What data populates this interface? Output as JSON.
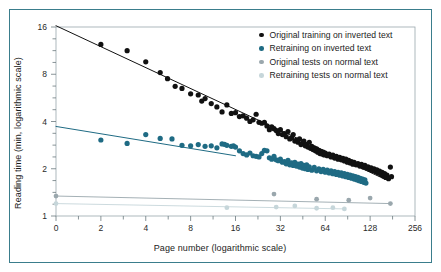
{
  "figure": {
    "frame_color": "#3a7d8c",
    "background": "#ffffff",
    "plot_border_color": "#9aa7ad"
  },
  "chart_data": {
    "type": "scatter",
    "title": "",
    "xlabel": "Page number (logarithmic scale)",
    "ylabel": "Reading time (min, logarithmic scale)",
    "xscale": "log2",
    "yscale": "log2",
    "xlim": [
      1,
      256
    ],
    "ylim": [
      1,
      16
    ],
    "grid": false,
    "legend_position": "top-right",
    "xticks": [
      1,
      2,
      4,
      8,
      16,
      32,
      64,
      128,
      256
    ],
    "xtick_labels": [
      "0",
      "2",
      "4",
      "8",
      "16",
      "32",
      "64",
      "128",
      "256"
    ],
    "yticks": [
      1,
      2,
      4,
      8,
      16
    ],
    "ytick_labels": [
      "1",
      "2",
      "4",
      "8",
      "16"
    ],
    "series": [
      {
        "name": "Original training on inverted text",
        "color": "#111111",
        "marker_size": 2.6,
        "trendline": {
          "x0": 1,
          "y0": 16.3,
          "x1": 160,
          "y1": 1.72,
          "width": 1.0
        },
        "points": [
          [
            2,
            12.4
          ],
          [
            3,
            11.3
          ],
          [
            4,
            9.6
          ],
          [
            5,
            8.2
          ],
          [
            5.6,
            7.5
          ],
          [
            6.3,
            6.7
          ],
          [
            7,
            6.5
          ],
          [
            8,
            6.0
          ],
          [
            9,
            5.9
          ],
          [
            9.5,
            5.4
          ],
          [
            10,
            5.6
          ],
          [
            11,
            5.2
          ],
          [
            12,
            4.95
          ],
          [
            13,
            4.6
          ],
          [
            14,
            5.1
          ],
          [
            15,
            4.5
          ],
          [
            16,
            4.55
          ],
          [
            17,
            4.3
          ],
          [
            18,
            4.35
          ],
          [
            19,
            4.2
          ],
          [
            20,
            4.0
          ],
          [
            21,
            4.1
          ],
          [
            22,
            4.45
          ],
          [
            23,
            3.95
          ],
          [
            24,
            3.9
          ],
          [
            25,
            3.95
          ],
          [
            26,
            3.75
          ],
          [
            27,
            3.55
          ],
          [
            28,
            3.7
          ],
          [
            29,
            3.6
          ],
          [
            30,
            3.5
          ],
          [
            31,
            3.35
          ],
          [
            32,
            3.55
          ],
          [
            33,
            3.3
          ],
          [
            34,
            3.35
          ],
          [
            35,
            3.2
          ],
          [
            36,
            3.45
          ],
          [
            37,
            3.1
          ],
          [
            38,
            3.15
          ],
          [
            39,
            3.3
          ],
          [
            40,
            3.0
          ],
          [
            41,
            3.05
          ],
          [
            42,
            2.95
          ],
          [
            43,
            3.1
          ],
          [
            44,
            2.85
          ],
          [
            45,
            2.9
          ],
          [
            46,
            3.0
          ],
          [
            47,
            2.8
          ],
          [
            48,
            2.85
          ],
          [
            49,
            2.75
          ],
          [
            50,
            2.95
          ],
          [
            51,
            2.7
          ],
          [
            52,
            2.78
          ],
          [
            53,
            2.65
          ],
          [
            54,
            2.72
          ],
          [
            55,
            2.6
          ],
          [
            56,
            2.68
          ],
          [
            57,
            2.55
          ],
          [
            58,
            2.62
          ],
          [
            59,
            2.5
          ],
          [
            60,
            2.58
          ],
          [
            61,
            2.48
          ],
          [
            62,
            2.55
          ],
          [
            63,
            2.45
          ],
          [
            64,
            2.52
          ],
          [
            66,
            2.42
          ],
          [
            68,
            2.48
          ],
          [
            70,
            2.38
          ],
          [
            72,
            2.44
          ],
          [
            74,
            2.34
          ],
          [
            76,
            2.4
          ],
          [
            78,
            2.3
          ],
          [
            80,
            2.36
          ],
          [
            82,
            2.28
          ],
          [
            84,
            2.33
          ],
          [
            86,
            2.24
          ],
          [
            88,
            2.3
          ],
          [
            90,
            2.2
          ],
          [
            92,
            2.26
          ],
          [
            94,
            2.18
          ],
          [
            96,
            2.22
          ],
          [
            98,
            2.14
          ],
          [
            100,
            2.2
          ],
          [
            103,
            2.12
          ],
          [
            106,
            2.16
          ],
          [
            109,
            2.08
          ],
          [
            112,
            2.13
          ],
          [
            115,
            2.05
          ],
          [
            118,
            2.1
          ],
          [
            121,
            2.02
          ],
          [
            124,
            2.06
          ],
          [
            127,
            1.98
          ],
          [
            130,
            2.03
          ],
          [
            133,
            1.95
          ],
          [
            136,
            2.0
          ],
          [
            139,
            1.92
          ],
          [
            142,
            1.97
          ],
          [
            145,
            1.88
          ],
          [
            148,
            1.93
          ],
          [
            151,
            1.84
          ],
          [
            154,
            1.9
          ],
          [
            157,
            1.8
          ],
          [
            160,
            1.86
          ],
          [
            163,
            1.76
          ],
          [
            166,
            1.82
          ],
          [
            170,
            1.73
          ],
          [
            175,
            2.05
          ],
          [
            178,
            1.78
          ]
        ]
      },
      {
        "name": "Retraining on inverted text",
        "color": "#1f6b84",
        "marker_size": 2.6,
        "trendline": {
          "x0": 1,
          "y0": 3.72,
          "x1": 16,
          "y1": 2.42,
          "width": 1.0
        },
        "points": [
          [
            2,
            3.05
          ],
          [
            3,
            2.9
          ],
          [
            4,
            3.3
          ],
          [
            5,
            3.12
          ],
          [
            6,
            3.1
          ],
          [
            7,
            2.82
          ],
          [
            8,
            2.8
          ],
          [
            9,
            2.85
          ],
          [
            10,
            2.78
          ],
          [
            11,
            2.8
          ],
          [
            12,
            2.72
          ],
          [
            13,
            2.88
          ],
          [
            13.5,
            2.86
          ],
          [
            14,
            2.82
          ],
          [
            15,
            2.78
          ],
          [
            15.5,
            2.8
          ],
          [
            16,
            2.75
          ],
          [
            17,
            2.6
          ],
          [
            18,
            2.5
          ],
          [
            19,
            2.45
          ],
          [
            20,
            2.52
          ],
          [
            21,
            2.42
          ],
          [
            22,
            2.4
          ],
          [
            23,
            2.38
          ],
          [
            24,
            2.5
          ],
          [
            25,
            2.62
          ],
          [
            26,
            2.6
          ],
          [
            27,
            2.35
          ],
          [
            28,
            2.3
          ],
          [
            29,
            2.4
          ],
          [
            30,
            2.28
          ],
          [
            31,
            2.25
          ],
          [
            32,
            2.3
          ],
          [
            33,
            2.2
          ],
          [
            34,
            2.22
          ],
          [
            35,
            2.15
          ],
          [
            36,
            2.26
          ],
          [
            37,
            2.12
          ],
          [
            38,
            2.18
          ],
          [
            39,
            2.1
          ],
          [
            40,
            2.2
          ],
          [
            41,
            2.08
          ],
          [
            42,
            2.14
          ],
          [
            43,
            2.05
          ],
          [
            44,
            2.16
          ],
          [
            45,
            2.02
          ],
          [
            46,
            2.1
          ],
          [
            47,
            2.0
          ],
          [
            48,
            2.12
          ],
          [
            49,
            1.98
          ],
          [
            50,
            2.06
          ],
          [
            52,
            1.96
          ],
          [
            54,
            2.04
          ],
          [
            56,
            1.94
          ],
          [
            58,
            2.0
          ],
          [
            60,
            1.92
          ],
          [
            62,
            1.98
          ],
          [
            64,
            1.9
          ],
          [
            66,
            1.96
          ],
          [
            68,
            1.88
          ],
          [
            70,
            1.94
          ],
          [
            72,
            1.86
          ],
          [
            74,
            1.92
          ],
          [
            76,
            1.84
          ],
          [
            78,
            1.9
          ],
          [
            80,
            1.82
          ],
          [
            82,
            1.88
          ],
          [
            84,
            1.8
          ],
          [
            86,
            1.86
          ],
          [
            88,
            1.78
          ],
          [
            90,
            1.84
          ],
          [
            92,
            1.76
          ],
          [
            94,
            1.82
          ],
          [
            96,
            1.74
          ],
          [
            98,
            1.8
          ],
          [
            100,
            1.72
          ],
          [
            102,
            1.78
          ],
          [
            104,
            1.7
          ],
          [
            106,
            1.76
          ],
          [
            108,
            1.68
          ],
          [
            110,
            1.74
          ],
          [
            112,
            1.66
          ],
          [
            114,
            1.72
          ],
          [
            116,
            1.64
          ],
          [
            118,
            1.7
          ],
          [
            120,
            1.62
          ]
        ]
      },
      {
        "name": "Original tests on normal text",
        "color": "#9aa7ad",
        "marker_size": 2.4,
        "trendline": {
          "x0": 1,
          "y0": 1.34,
          "x1": 175,
          "y1": 1.2,
          "width": 0.9
        },
        "points": [
          [
            1,
            1.34
          ],
          [
            29,
            1.38
          ],
          [
            56,
            1.28
          ],
          [
            92,
            1.26
          ],
          [
            128,
            1.3
          ],
          [
            175,
            1.2
          ]
        ]
      },
      {
        "name": "Retraining tests on normal text",
        "color": "#c6d6da",
        "marker_size": 2.4,
        "trendline": {
          "x0": 1,
          "y0": 1.2,
          "x1": 86,
          "y1": 1.11,
          "width": 0.9
        },
        "points": [
          [
            1,
            1.2
          ],
          [
            14,
            1.13
          ],
          [
            30,
            1.14
          ],
          [
            40,
            1.16
          ],
          [
            56,
            1.12
          ],
          [
            72,
            1.13
          ],
          [
            86,
            1.11
          ]
        ]
      }
    ]
  },
  "legend": {
    "items": [
      {
        "label": "Original training on inverted text",
        "color": "#111111"
      },
      {
        "label": "Retraining on inverted text",
        "color": "#1f6b84"
      },
      {
        "label": "Original tests on normal text",
        "color": "#9aa7ad"
      },
      {
        "label": "Retraining tests on normal text",
        "color": "#c6d6da"
      }
    ]
  }
}
